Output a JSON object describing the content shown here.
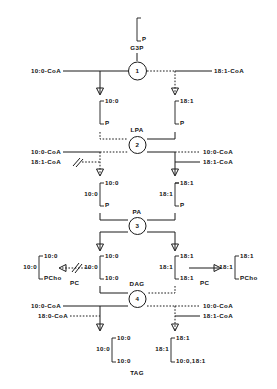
{
  "diagram": {
    "g3p": {
      "top_slot": "",
      "bottom_slot": "P",
      "name": "G3P"
    },
    "step1": {
      "enzyme_number": "1",
      "left_substrate": "10:0-CoA",
      "right_substrate": "18:1-CoA"
    },
    "lpa": {
      "name": "LPA",
      "enzyme_number": "2",
      "left_bracket": {
        "top": "10:0",
        "bottom": "P"
      },
      "right_bracket": {
        "top": "18:1",
        "bottom": "P"
      },
      "left_inputs": [
        "10:0-CoA",
        "18:1-CoA"
      ],
      "right_outputs": [
        "10:0-CoA",
        "18:1-CoA"
      ]
    },
    "pa": {
      "name": "PA",
      "enzyme_number": "3",
      "left_prefix": "10:0",
      "left_bracket": {
        "top": "10:0",
        "bottom": "P"
      },
      "right_prefix": "18:1",
      "right_bracket": {
        "top": "18:1",
        "bottom": "P"
      }
    },
    "dag": {
      "name": "DAG",
      "enzyme_number": "4",
      "left_prefix": "10:0",
      "left_bracket": {
        "top": "10:0",
        "bottom": "10:0"
      },
      "right_prefix": "18:1",
      "right_bracket": {
        "top": "18:1",
        "bottom": "18:1"
      },
      "left_inputs": [
        "10:0-CoA",
        "18:0-CoA"
      ],
      "right_outputs": [
        "10:0-CoA",
        "18:1-CoA"
      ]
    },
    "pc_left": {
      "name": "PC",
      "prefix": "10:0",
      "bracket": {
        "top": "10:0",
        "bottom": "PCho"
      }
    },
    "pc_right": {
      "name": "PC",
      "prefix": "18:1",
      "bracket": {
        "top": "18:1",
        "bottom": "PCho"
      }
    },
    "tag": {
      "name": "TAG",
      "left_prefix": "10:0",
      "left_bracket": {
        "top": "10:0",
        "bottom": "10:0"
      },
      "right_prefix": "18:1",
      "right_bracket": {
        "top": "18:1",
        "bottom": "10:0,18:1"
      }
    }
  }
}
